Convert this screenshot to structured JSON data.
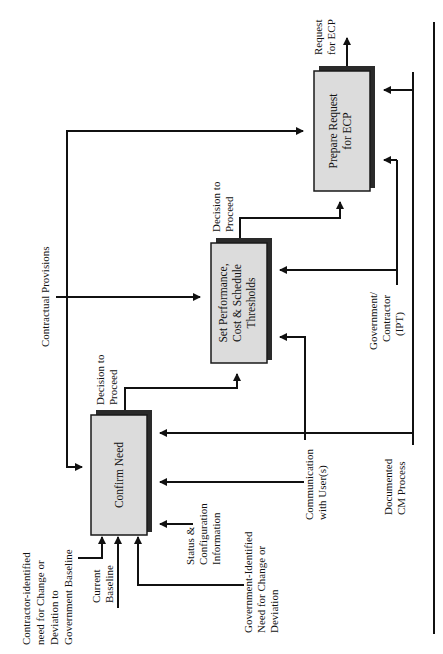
{
  "diagram": {
    "orientation": "rotated-90-ccw",
    "boxes": [
      {
        "id": "confirm",
        "label_lines": [
          "Confirm Need"
        ]
      },
      {
        "id": "set",
        "label_lines": [
          "Set Performance,",
          "Cost & Schedule",
          "Thresholds"
        ]
      },
      {
        "id": "prepare",
        "label_lines": [
          "Prepare Request",
          "for ECP"
        ]
      }
    ],
    "labels": {
      "contractor_need": [
        "Contractor-identified",
        "need for Change or",
        "Deviation to",
        "Government Baseline"
      ],
      "current_baseline": [
        "Current",
        "Baseline"
      ],
      "status_config": [
        "Status &",
        "Configuration",
        "Information"
      ],
      "gov_need": [
        "Government-Identified",
        "Need for Change or",
        "Deviation"
      ],
      "communication": [
        "Communication",
        "with User(s)"
      ],
      "documented_cm": [
        "Documented",
        "CM Process"
      ],
      "gov_contractor": [
        "Government/",
        "Contractor",
        "(IPT)"
      ],
      "contractual": [
        "Contractual Provisions"
      ],
      "decision1": [
        "Decision to",
        "Proceed"
      ],
      "decision2": [
        "Decision to",
        "Proceed"
      ],
      "request": [
        "Request",
        "for ECP"
      ]
    }
  }
}
